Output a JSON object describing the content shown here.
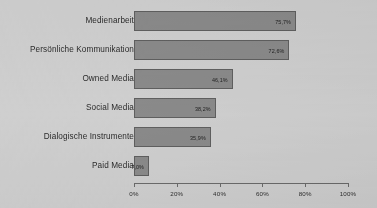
{
  "chart_data": {
    "type": "bar",
    "orientation": "horizontal",
    "title": "",
    "subtitle": "",
    "xlabel": "",
    "ylabel": "",
    "xlim": [
      0,
      100
    ],
    "grid": false,
    "legend": null,
    "categories": [
      "Medienarbeit",
      "Persönliche Kommunikation",
      "Owned Media",
      "Social Media",
      "Dialogische Instrumente",
      "Paid Media"
    ],
    "values": [
      75.7,
      72.6,
      46.1,
      38.2,
      35.9,
      7.0
    ],
    "value_labels": [
      "75,7%",
      "72,6%",
      "46,1%",
      "38,2%",
      "35,9%",
      "7,0%"
    ],
    "xticks": [
      0,
      20,
      40,
      60,
      80,
      100
    ],
    "xtick_labels": [
      "0%",
      "20%",
      "40%",
      "60%",
      "80%",
      "100%"
    ],
    "colors": {
      "bar_fill": "#8a8a8a",
      "bar_border": "#5f5f5f",
      "axis": "#6b6b6b",
      "background": "#cfcfcf",
      "text": "#2b2b2b"
    }
  }
}
